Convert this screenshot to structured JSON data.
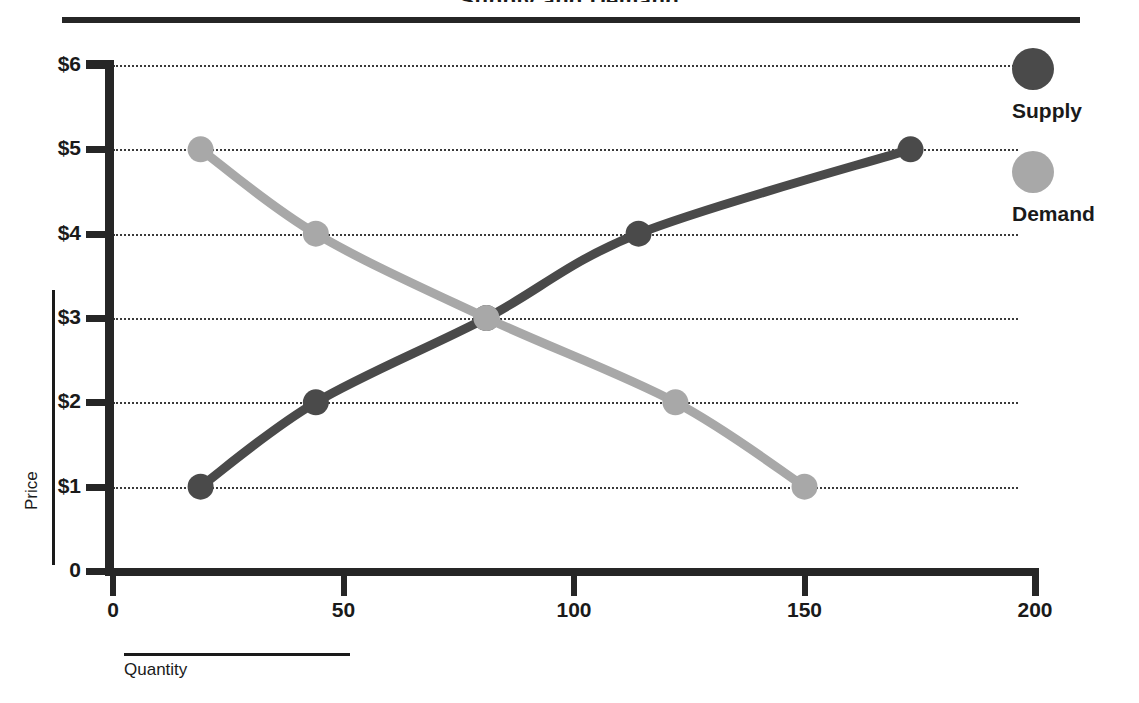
{
  "chart_data": {
    "type": "line",
    "title": "Supply and Demand",
    "title_visible_fragment": "y",
    "xlabel": "Quantity",
    "ylabel": "Price",
    "xlim": [
      0,
      200
    ],
    "ylim": [
      0,
      6
    ],
    "grid": "horizontal-dotted",
    "legend_position": "right",
    "x_ticks": [
      "0",
      "50",
      "100",
      "150",
      "200"
    ],
    "x_tick_values": [
      0,
      50,
      100,
      150,
      200
    ],
    "y_ticks": [
      "0",
      "$1",
      "$2",
      "$3",
      "$4",
      "$5",
      "$6"
    ],
    "y_tick_values": [
      0,
      1,
      2,
      3,
      4,
      5,
      6
    ],
    "equilibrium": {
      "quantity": 81,
      "price": 3
    },
    "series": [
      {
        "name": "Supply",
        "color": "#4a4a4a",
        "x": [
          19,
          44,
          81,
          114,
          173
        ],
        "values": [
          1,
          2,
          3,
          4,
          5
        ]
      },
      {
        "name": "Demand",
        "color": "#a8a8a8",
        "x": [
          19,
          44,
          81,
          122,
          150
        ],
        "values": [
          5,
          4,
          3,
          2,
          1
        ]
      }
    ]
  },
  "legend": {
    "items": [
      {
        "label": "Supply",
        "color": "#4a4a4a"
      },
      {
        "label": "Demand",
        "color": "#a8a8a8"
      }
    ]
  },
  "axes": {
    "y_title": "Price",
    "x_title": "Quantity"
  }
}
